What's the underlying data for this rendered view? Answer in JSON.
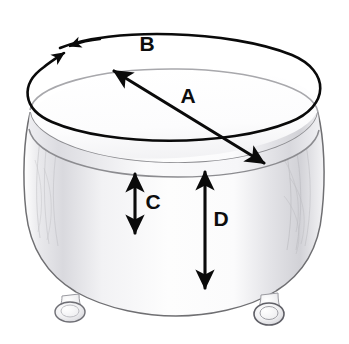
{
  "diagram": {
    "background_color": "#ffffff",
    "ink_color": "#0a0a0a",
    "body_outline_color": "#6f6f72",
    "shading_color": "#d4d4d8",
    "labels": {
      "a": "A",
      "b": "B",
      "c": "C",
      "d": "D"
    },
    "measurements": [
      {
        "key": "A",
        "label": "A",
        "name": "top-diameter",
        "description": "Diameter across the top of the ottoman",
        "marker": "double-headed arrow across seat top",
        "label_x": 188,
        "label_y": 97,
        "from_x": 114,
        "from_y": 71,
        "to_x": 264,
        "to_y": 163
      },
      {
        "key": "B",
        "label": "B",
        "name": "top-circumference",
        "description": "Circumference around the top edge",
        "marker": "ellipse loop with meeting arrowheads",
        "label_x": 147,
        "label_y": 45,
        "center_x": 175,
        "center_y": 89,
        "radius_x": 147,
        "radius_y": 50,
        "rotation_deg": -4
      },
      {
        "key": "C",
        "label": "C",
        "name": "skirt-height",
        "description": "Height of the lower skirt section",
        "marker": "vertical double-headed arrow",
        "label_x": 153,
        "label_y": 203,
        "x": 135,
        "top_y": 174,
        "bottom_y": 233
      },
      {
        "key": "D",
        "label": "D",
        "name": "overall-side-height",
        "description": "Height from seam to bottom edge",
        "marker": "vertical double-headed arrow",
        "label_x": 221,
        "label_y": 220,
        "x": 205,
        "top_y": 172,
        "bottom_y": 288
      }
    ],
    "parts": [
      {
        "name": "seat-top",
        "label": "seat top"
      },
      {
        "name": "seam-band",
        "label": "seam band"
      },
      {
        "name": "body-skirt",
        "label": "body skirt"
      },
      {
        "name": "foot-left",
        "label": "left bun foot"
      },
      {
        "name": "foot-right",
        "label": "right bun foot"
      }
    ]
  }
}
